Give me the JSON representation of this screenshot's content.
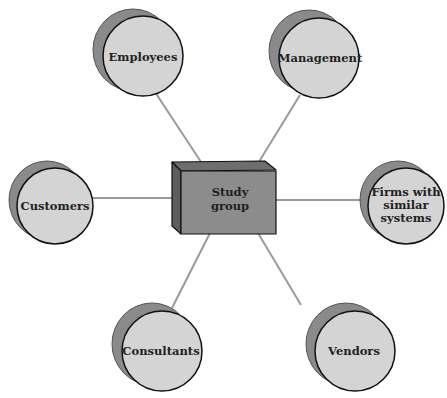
{
  "diagram": {
    "center": {
      "label_line1": "Study",
      "label_line2": "group"
    },
    "nodes": [
      {
        "id": "employees",
        "label_line1": "Employees",
        "label_line2": "",
        "label_line3": ""
      },
      {
        "id": "management",
        "label_line1": "Management",
        "label_line2": "",
        "label_line3": ""
      },
      {
        "id": "customers",
        "label_line1": "Customers",
        "label_line2": "",
        "label_line3": ""
      },
      {
        "id": "firms",
        "label_line1": "Firms with",
        "label_line2": "similar",
        "label_line3": "systems"
      },
      {
        "id": "consultants",
        "label_line1": "Consultants",
        "label_line2": "",
        "label_line3": ""
      },
      {
        "id": "vendors",
        "label_line1": "Vendors",
        "label_line2": "",
        "label_line3": ""
      }
    ],
    "colors": {
      "circle_face": "#d4d4d4",
      "circle_shadow": "#8a8a8a",
      "box_front": "#8c8c8c",
      "box_side": "#5e5e5e",
      "box_top": "#6e6e6e",
      "connector": "#9a9a9a",
      "outline": "#111111"
    }
  }
}
